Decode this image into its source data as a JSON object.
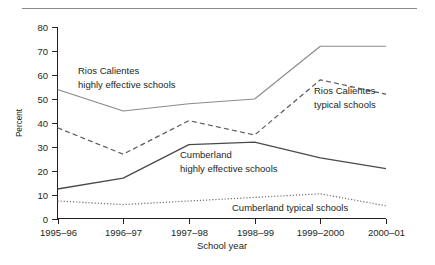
{
  "figure": {
    "ylabel": "Percent",
    "xlabel": "School year",
    "top_rule_color": "#8c8c8c",
    "axis_color": "#231f20"
  },
  "chart_data": {
    "type": "line",
    "title": "",
    "xlabel": "School year",
    "ylabel": "Percent",
    "categories": [
      "1995–96",
      "1996–97",
      "1997–98",
      "1998–99",
      "1999–2000",
      "2000–01"
    ],
    "ylim": [
      0,
      80
    ],
    "yticks": [
      0,
      10,
      20,
      30,
      40,
      50,
      60,
      70,
      80
    ],
    "grid": false,
    "legend": "inline-annotations",
    "series": [
      {
        "name": "Rios Calientes highly effective schools",
        "style": "solid",
        "color": "#8a8a8a",
        "width": 1.1,
        "values": [
          54,
          45,
          48,
          50,
          72,
          72
        ]
      },
      {
        "name": "Rios Calientes typical schools",
        "style": "dashed",
        "color": "#5a5a5a",
        "width": 1.2,
        "values": [
          38,
          27,
          41,
          35,
          58,
          52
        ]
      },
      {
        "name": "Cumberland highly effective schools",
        "style": "solid",
        "color": "#4a4a4a",
        "width": 1.3,
        "values": [
          12.5,
          17,
          31,
          32,
          25.5,
          21
        ]
      },
      {
        "name": "Cumberland typical schools",
        "style": "dotted",
        "color": "#6e6e6e",
        "width": 1.2,
        "values": [
          7.5,
          6,
          7.5,
          9,
          10.5,
          5.5
        ]
      }
    ],
    "annotations": [
      {
        "text": "Rios Calientes",
        "x": 78,
        "y": 74
      },
      {
        "text": "highly effective schools",
        "x": 78,
        "y": 88
      },
      {
        "text": "Rios Calientes",
        "x": 314,
        "y": 94
      },
      {
        "text": "typical schools",
        "x": 314,
        "y": 108
      },
      {
        "text": "Cumberland",
        "x": 180,
        "y": 158
      },
      {
        "text": "highly effective schools",
        "x": 180,
        "y": 172
      },
      {
        "text": "Cumberland typical schools",
        "x": 232,
        "y": 211
      }
    ]
  }
}
